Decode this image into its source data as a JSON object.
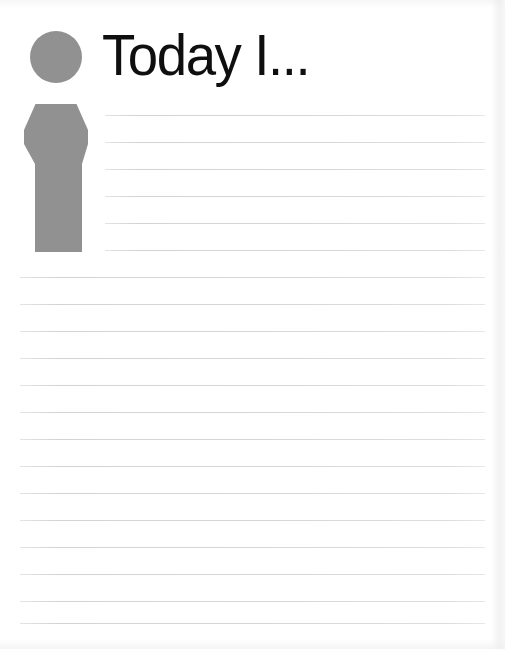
{
  "page": {
    "title": "Today I...",
    "width": 505,
    "height": 649,
    "background_color": "#ffffff",
    "type": "journal-prompt-worksheet"
  },
  "header": {
    "title": "Today I...",
    "title_color": "#100f10",
    "icon": {
      "name": "person-figure-icon",
      "color": "#919191",
      "description": "gray silhouette of a person: circular head above a tapered shouldered body"
    }
  },
  "writing_area": {
    "line_color": "#d5d6da",
    "line_spacing_px": 27,
    "indented_lines": {
      "count": 6,
      "left_px": 105,
      "right_px": 485,
      "y_positions": [
        115,
        142,
        169,
        196,
        223,
        250
      ]
    },
    "full_width_lines": {
      "count": 14,
      "left_px": 20,
      "right_px": 485,
      "y_positions": [
        277,
        304,
        331,
        358,
        385,
        412,
        439,
        466,
        493,
        520,
        547,
        574,
        601,
        623
      ]
    }
  }
}
